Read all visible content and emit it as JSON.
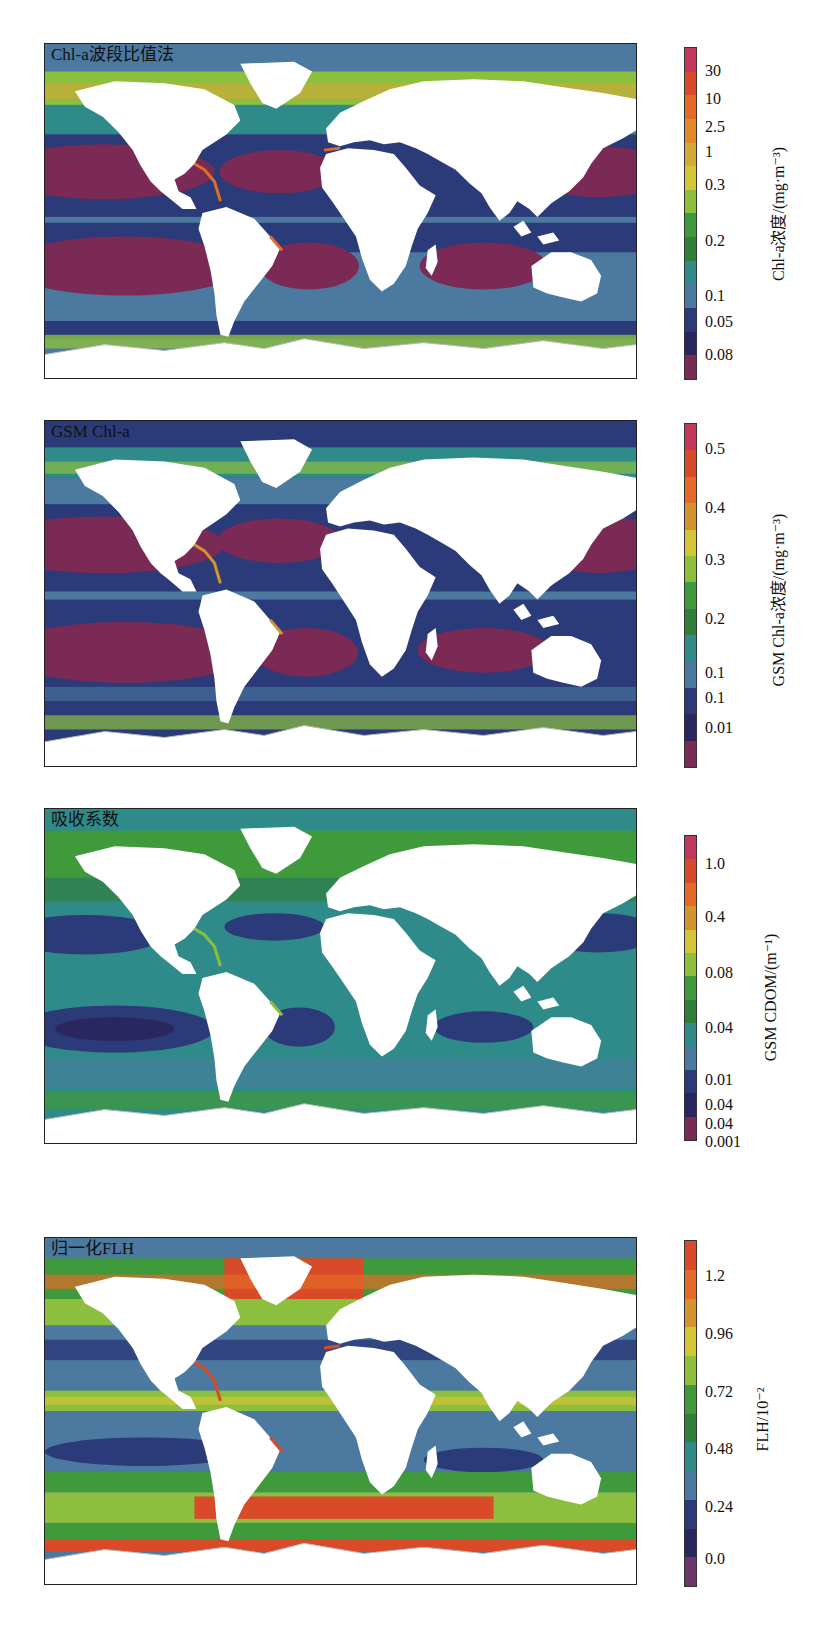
{
  "figure": {
    "panels": [
      {
        "id": "chl-band-ratio",
        "title": "Chl-a波段比值法",
        "colorbar": {
          "label": "Chl-a浓度/(mg·m⁻³)",
          "ticks": [
            "30",
            "10",
            "2.5",
            "1",
            "0.3",
            "0.2",
            "0.1",
            "0.05",
            "0.08"
          ],
          "colors": [
            "#c2385a",
            "#d84a28",
            "#e46a28",
            "#e08a2a",
            "#d4a93a",
            "#d2c536",
            "#8cbf3e",
            "#3f9a3c",
            "#2f7f3a",
            "#2f8a8a",
            "#4b79a0",
            "#2b3a78",
            "#2a2760",
            "#7a2a55"
          ]
        }
      },
      {
        "id": "gsm-chl",
        "title": "GSM Chl-a",
        "colorbar": {
          "label": "GSM Chl-a浓度/(mg·m⁻³)",
          "ticks": [
            "0.5",
            "0.4",
            "0.3",
            "0.2",
            "0.1",
            "0.1",
            "0.01"
          ],
          "colors": [
            "#c2385a",
            "#d84a28",
            "#e46a28",
            "#d4932e",
            "#d2c536",
            "#8cbf3e",
            "#3f9a3c",
            "#2f7f3a",
            "#2f8a8a",
            "#4b79a0",
            "#2b3a78",
            "#2a2760",
            "#7a2a55"
          ]
        }
      },
      {
        "id": "cdom-absorption",
        "title": "吸收系数",
        "colorbar": {
          "label": "GSM CDOM/(m⁻¹)",
          "ticks": [
            "1.0",
            "0.4",
            "0.08",
            "0.04",
            "0.01",
            "0.04",
            "0.04",
            "0.001"
          ],
          "colors": [
            "#c2385a",
            "#d84a28",
            "#e46a28",
            "#d4932e",
            "#d2c536",
            "#8cbf3e",
            "#3f9a3c",
            "#2f7f3a",
            "#2f8a8a",
            "#4b79a0",
            "#2b3a78",
            "#2a2760",
            "#7a2a55"
          ]
        }
      },
      {
        "id": "normalized-flh",
        "title": "归一化FLH",
        "colorbar": {
          "label": "FLH/10⁻²",
          "ticks": [
            "1.2",
            "0.96",
            "0.72",
            "0.48",
            "0.24",
            "0.0"
          ],
          "colors": [
            "#d84a28",
            "#e46a28",
            "#d4932e",
            "#d2c536",
            "#8cbf3e",
            "#3f9a3c",
            "#2f7f3a",
            "#2f8a8a",
            "#4b79a0",
            "#2b3a78",
            "#2a2760",
            "#6a3868"
          ]
        }
      }
    ]
  },
  "chart_data": [
    {
      "type": "heatmap",
      "title": "Chl-a波段比值法",
      "colorbar_label": "Chl-a浓度/(mg·m⁻³)",
      "colorbar_ticks": [
        "30",
        "10",
        "2.5",
        "1",
        "0.3",
        "0.2",
        "0.1",
        "0.05",
        "0.08"
      ],
      "description": "Global map; oligotrophic subtropical gyres lowest (dark red/purple), coastal and high-latitude waters highest (orange/red)"
    },
    {
      "type": "heatmap",
      "title": "GSM Chl-a",
      "colorbar_label": "GSM Chl-a浓度/(mg·m⁻³)",
      "colorbar_ticks": [
        "0.5",
        "0.4",
        "0.3",
        "0.2",
        "0.1",
        "0.1",
        "0.01"
      ],
      "description": "Global map; subtropical gyres lowest, coastal and high-latitude waters highest"
    },
    {
      "type": "heatmap",
      "title": "吸收系数",
      "colorbar_label": "GSM CDOM/(m⁻¹)",
      "colorbar_ticks": [
        "1.0",
        "0.4",
        "0.08",
        "0.04",
        "0.01",
        "0.04",
        "0.04",
        "0.001"
      ],
      "description": "Global map; teal background, dark-blue gyres, green at high latitudes and coasts"
    },
    {
      "type": "heatmap",
      "title": "归一化FLH",
      "colorbar_label": "FLH/10⁻²",
      "colorbar_ticks": [
        "1.2",
        "0.96",
        "0.72",
        "0.48",
        "0.24",
        "0.0"
      ],
      "description": "Global map; blue tropical/subtropical oceans, orange-red in North Atlantic and Southern Ocean, green-yellow bands in between"
    }
  ]
}
